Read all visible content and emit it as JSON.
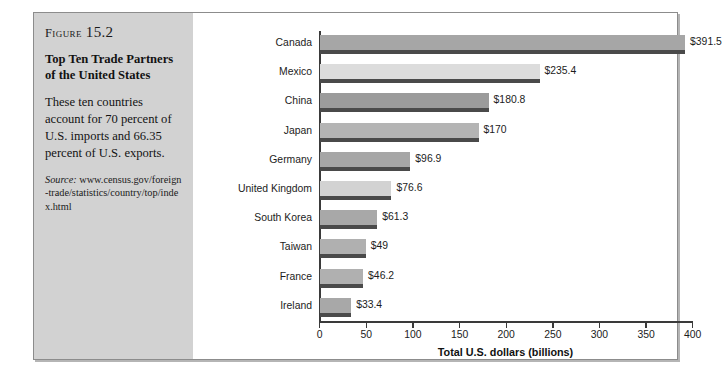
{
  "figure": {
    "label_word": "Figure",
    "label_number": "15.2",
    "title": "Top Ten Trade Partners of the United States",
    "description": "These ten countries account for 70 percent of U.S. imports and 66.35 percent of U.S. exports.",
    "source_word": "Source:",
    "source_url": "www.census.gov/foreign-trade/statistics/country/top/index.html"
  },
  "chart_data": {
    "type": "bar",
    "orientation": "horizontal",
    "title": "Top Ten Trade Partners of the United States",
    "xlabel": "Total U.S. dollars (billions)",
    "ylabel": "",
    "xlim": [
      0,
      400
    ],
    "xticks": [
      0,
      50,
      100,
      150,
      200,
      250,
      300,
      350,
      400
    ],
    "xtick_labels": [
      "0",
      "50",
      "100",
      "150",
      "200",
      "250",
      "300",
      "350",
      "400"
    ],
    "grid": false,
    "legend": false,
    "categories": [
      "Canada",
      "Mexico",
      "China",
      "Japan",
      "Germany",
      "United Kingdom",
      "South Korea",
      "Taiwan",
      "France",
      "Ireland"
    ],
    "values": [
      391.5,
      235.4,
      180.8,
      170,
      96.9,
      76.6,
      61.3,
      49,
      46.2,
      33.4
    ],
    "value_labels": [
      "$391.5",
      "$235.4",
      "$180.8",
      "$170",
      "$96.9",
      "$76.6",
      "$61.3",
      "$49",
      "$46.2",
      "$33.4"
    ],
    "bar_colors": [
      "#a6a6a6",
      "#dcdcdc",
      "#9b9b9b",
      "#b4b4b4",
      "#a6a6a6",
      "#d2d2d2",
      "#a8a8a8",
      "#b0b0b0",
      "#b0b0b0",
      "#a8a8a8"
    ],
    "bar_shadow_color": "#4a4a4a",
    "axis_color": "#3a3a3a",
    "panel_color": "#d2d2d2"
  }
}
